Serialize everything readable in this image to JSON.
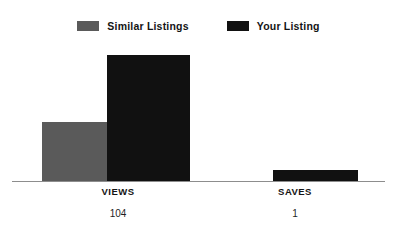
{
  "chart_data": {
    "type": "bar",
    "title": "",
    "subtitle": "",
    "xlabel": "",
    "ylabel": "",
    "grid": false,
    "legend_position": "top-center",
    "categories": [
      "VIEWS",
      "SAVES"
    ],
    "category_values": [
      "104",
      "1"
    ],
    "ylim": [
      0,
      110
    ],
    "series": [
      {
        "name": "Similar Listings",
        "color": "#5a5a5a",
        "values": [
          49,
          0
        ]
      },
      {
        "name": "Your Listing",
        "color": "#111111",
        "values": [
          104,
          1
        ]
      }
    ],
    "annotations": [
      "104",
      "1"
    ]
  },
  "legend": {
    "items": [
      {
        "label": "Similar Listings",
        "swatch_icon": "legend-swatch-gray",
        "color": "#5a5a5a"
      },
      {
        "label": "Your Listing",
        "swatch_icon": "legend-swatch-black",
        "color": "#111111"
      }
    ]
  },
  "axis": {
    "baseline_color": "#8d8d8d"
  },
  "categories": [
    {
      "label": "VIEWS",
      "value": "104"
    },
    {
      "label": "SAVES",
      "value": "1"
    }
  ],
  "colors": {
    "background": "#ffffff",
    "similar_listings": "#5a5a5a",
    "your_listing": "#111111",
    "axis": "#8d8d8d",
    "text": "#141414"
  }
}
